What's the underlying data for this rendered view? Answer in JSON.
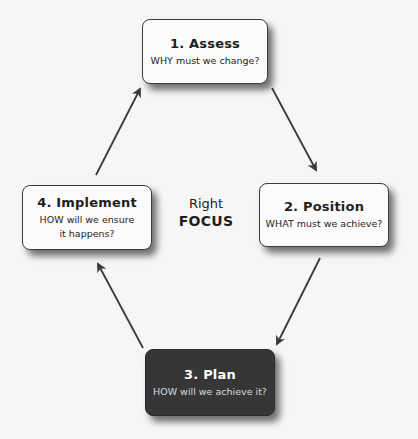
{
  "diagram": {
    "type": "cycle",
    "center": {
      "line1": "Right",
      "line2": "FOCUS"
    },
    "steps": [
      {
        "id": "assess",
        "title": "1. Assess",
        "subtitle": "WHY must we change?",
        "style": "light"
      },
      {
        "id": "position",
        "title": "2. Position",
        "subtitle": "WHAT must we achieve?",
        "style": "light"
      },
      {
        "id": "plan",
        "title": "3. Plan",
        "subtitle": "HOW will we achieve it?",
        "style": "dark"
      },
      {
        "id": "implement",
        "title": "4. Implement",
        "subtitle": "HOW will we ensure it happens?",
        "style": "light"
      }
    ],
    "edges": [
      {
        "from": "assess",
        "to": "position"
      },
      {
        "from": "position",
        "to": "plan"
      },
      {
        "from": "plan",
        "to": "implement"
      },
      {
        "from": "implement",
        "to": "assess"
      }
    ],
    "colors": {
      "background": "#f6f6f5",
      "box_fill": "#fbfbfb",
      "box_border": "#3c3c3c",
      "dark_box_fill": "#363636",
      "arrow": "#3a3a3a",
      "text": "#1e1e1e"
    }
  }
}
